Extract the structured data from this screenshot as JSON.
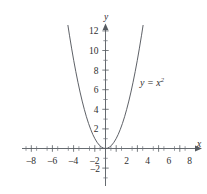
{
  "figure": {
    "background_color": "#ffffff",
    "axis_color": "#555a60",
    "curve_color": "#55595f",
    "text_color": "#2e2e2e"
  },
  "labels": {
    "x_axis_name": "x",
    "y_axis_name": "y",
    "curve_label_base": "y = x",
    "curve_label_exponent": "2",
    "curve_label_full": "y = x2"
  },
  "chart_data": {
    "type": "line",
    "title": "",
    "subtitle": "",
    "xlabel": "x",
    "ylabel": "y",
    "grid": false,
    "legend_position": "inline-right",
    "annotations": [
      {
        "text": "y = x²",
        "x": 4.2,
        "y": 7.0
      }
    ],
    "xlim": [
      -9.5,
      9.3
    ],
    "ylim": [
      -4.0,
      13.2
    ],
    "xticks": [
      -8,
      -6,
      -4,
      -2,
      2,
      4,
      6,
      8
    ],
    "xticklabels": [
      "–8",
      "–6",
      "–4",
      "–2",
      "2",
      "4",
      "6",
      "8"
    ],
    "xminorticks": [
      -9,
      -7,
      -5,
      -3,
      -1,
      1,
      3,
      5,
      7,
      9
    ],
    "yticks": [
      2,
      4,
      6,
      8,
      10,
      12,
      -2
    ],
    "yticklabels": [
      "2",
      "4",
      "6",
      "8",
      "10",
      "12",
      "–2"
    ],
    "yminorticks": [
      1,
      3,
      5,
      7,
      9,
      11,
      -1,
      -3
    ],
    "series": [
      {
        "name": "y = x^2",
        "equation": "y = x^2",
        "x": [
          -3.55,
          -3.4,
          -3.2,
          -3.0,
          -2.8,
          -2.6,
          -2.4,
          -2.2,
          -2.0,
          -1.8,
          -1.6,
          -1.4,
          -1.2,
          -1.0,
          -0.8,
          -0.6,
          -0.4,
          -0.2,
          0.0,
          0.2,
          0.4,
          0.6,
          0.8,
          1.0,
          1.2,
          1.4,
          1.6,
          1.8,
          2.0,
          2.2,
          2.4,
          2.6,
          2.8,
          3.0,
          3.2,
          3.4,
          3.55
        ],
        "values": [
          12.6,
          11.56,
          10.24,
          9.0,
          7.84,
          6.76,
          5.76,
          4.84,
          4.0,
          3.24,
          2.56,
          1.96,
          1.44,
          1.0,
          0.64,
          0.36,
          0.16,
          0.04,
          0.0,
          0.04,
          0.16,
          0.36,
          0.64,
          1.0,
          1.44,
          1.96,
          2.56,
          3.24,
          4.0,
          4.84,
          5.76,
          6.76,
          7.84,
          9.0,
          10.24,
          11.56,
          12.6
        ]
      }
    ]
  }
}
